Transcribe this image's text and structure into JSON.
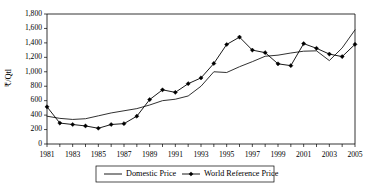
{
  "chart_data": {
    "type": "line",
    "title": "",
    "xlabel": "",
    "ylabel": "₹/Qtl",
    "x": [
      1981,
      1982,
      1983,
      1984,
      1985,
      1986,
      1987,
      1988,
      1989,
      1990,
      1991,
      1992,
      1993,
      1994,
      1995,
      1996,
      1997,
      1998,
      1999,
      2000,
      2001,
      2002,
      2003,
      2004,
      2005
    ],
    "xlim": [
      1981,
      2005
    ],
    "ylim": [
      0,
      1800
    ],
    "y_ticks": [
      0,
      200,
      400,
      600,
      800,
      1000,
      1200,
      1400,
      1600,
      1800
    ],
    "y_tick_labels": [
      "0",
      "200",
      "400",
      "600",
      "800",
      "1,000",
      "1,200",
      "1,400",
      "1,600",
      "1,800"
    ],
    "x_tick_labels": [
      "1981",
      "",
      "1983",
      "",
      "1985",
      "",
      "1987",
      "",
      "1989",
      "",
      "1991",
      "",
      "1993",
      "",
      "1995",
      "",
      "1997",
      "",
      "1999",
      "",
      "2001",
      "",
      "2003",
      "",
      "2005"
    ],
    "grid": false,
    "legend_position": "bottom",
    "series": [
      {
        "name": "Domestic Price",
        "marker": "none",
        "color": "#000000",
        "values": [
          385,
          355,
          340,
          350,
          390,
          430,
          460,
          490,
          540,
          600,
          620,
          665,
          800,
          1000,
          990,
          1070,
          1140,
          1215,
          1230,
          1260,
          1285,
          1290,
          1155,
          1330,
          1580
        ]
      },
      {
        "name": "World Reference Price",
        "marker": "diamond",
        "color": "#000000",
        "values": [
          515,
          290,
          270,
          250,
          218,
          270,
          282,
          385,
          615,
          750,
          715,
          835,
          915,
          1115,
          1378,
          1480,
          1300,
          1265,
          1110,
          1085,
          1390,
          1325,
          1245,
          1210,
          1380
        ]
      }
    ]
  },
  "legend": {
    "items": [
      {
        "label": "Domestic Price",
        "marker": "none"
      },
      {
        "label": "World Reference Price",
        "marker": "diamond"
      }
    ]
  }
}
